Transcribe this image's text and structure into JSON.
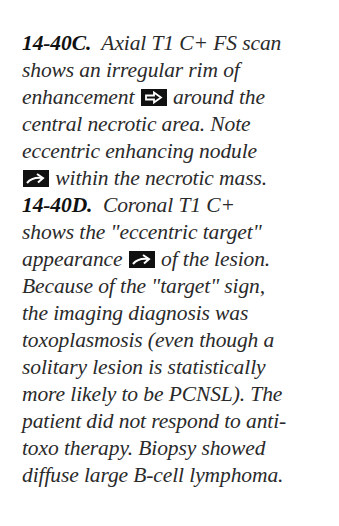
{
  "caption": {
    "figure_c": {
      "label": "14-40C.",
      "lines": [
        "Axial T1 C+ FS scan",
        "shows an irregular rim of",
        "enhancement",
        "around the",
        "central necrotic area. Note",
        "eccentric enhancing nodule",
        "within the necrotic mass."
      ]
    },
    "figure_d": {
      "label": "14-40D.",
      "lines": [
        "Coronal T1 C+",
        "shows the \"eccentric target\"",
        "appearance",
        "of the lesion.",
        "Because of the \"target\" sign,",
        "the imaging diagnosis was",
        "toxoplasmosis (even though a",
        "solitary lesion is statistically",
        "more likely to be PCNSL). The",
        "patient did not respond to anti-",
        "toxo therapy. Biopsy showed",
        "diffuse large B-cell lymphoma."
      ]
    },
    "icons": {
      "open_arrow": "open-arrow-icon",
      "curved_arrow": "curved-arrow-icon"
    }
  }
}
